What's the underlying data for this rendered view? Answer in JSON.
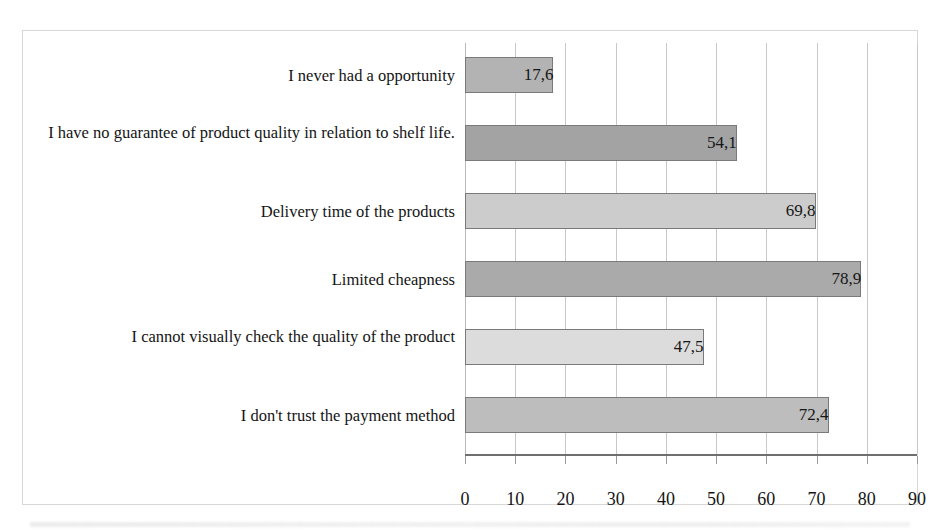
{
  "chart_data": {
    "type": "bar",
    "orientation": "horizontal",
    "title": "",
    "xlabel": "",
    "ylabel": "",
    "categories": [
      "I never had a opportunity",
      "I have no guarantee of product quality in relation to shelf life.",
      "Delivery time of the products",
      "Limited cheapness",
      "I cannot visually check the quality of the product",
      "I don't trust the payment method"
    ],
    "values": [
      17.6,
      54.1,
      69.8,
      78.9,
      47.5,
      72.4
    ],
    "value_labels": [
      "17,6",
      "54,1",
      "69,8",
      "78,9",
      "47,5",
      "72,4"
    ],
    "bar_colors": [
      "#b3b3b3",
      "#a3a3a3",
      "#cccccc",
      "#aaaaaa",
      "#dcdcdc",
      "#bdbdbd"
    ],
    "bar_border_color": "#7a7a7a",
    "xlim": [
      0,
      90
    ],
    "xticks": [
      0,
      10,
      20,
      30,
      40,
      50,
      60,
      70,
      80,
      90
    ],
    "xtick_labels": [
      "0",
      "10",
      "20",
      "30",
      "40",
      "50",
      "60",
      "70",
      "80",
      "90"
    ],
    "grid": "vertical",
    "gridline_color": "#c9c9c9",
    "legend": "none",
    "frame_border_color": "#d8d8d8"
  }
}
